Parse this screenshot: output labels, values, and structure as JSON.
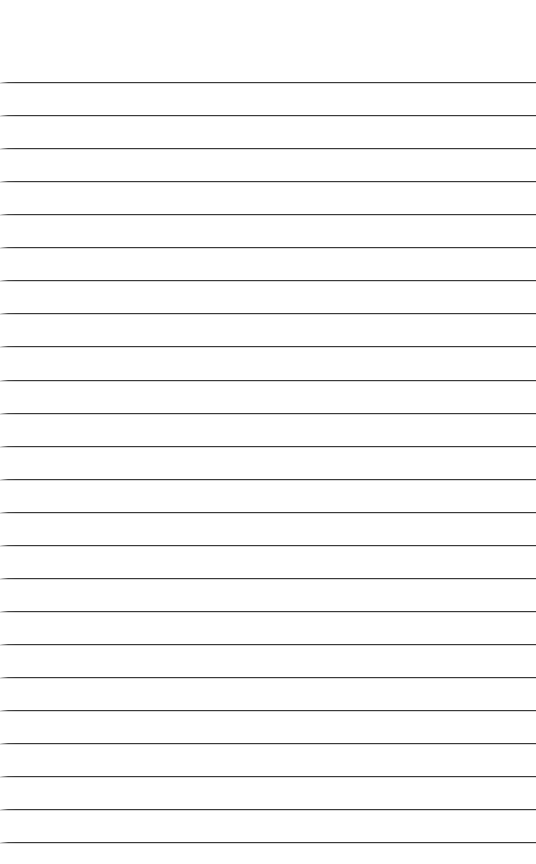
{
  "page": {
    "kind": "ruled-paper-sheet",
    "width": 536,
    "height": 864,
    "background_color": "#ffffff",
    "text_content": "",
    "is_blank": "true"
  },
  "rules": {
    "count": 24,
    "color": "#3a3a3a",
    "thickness_px": 1.3,
    "spacing_px": 33.0,
    "first_line_y": 82,
    "last_line_y": 842,
    "left_inset_px": 0,
    "right_inset_px": 0,
    "top_margin_px": 81,
    "bottom_margin_px": 22,
    "positions": [
      82,
      115,
      148,
      181,
      214,
      247,
      280,
      313,
      346,
      380,
      413,
      446,
      479,
      512,
      545,
      578,
      611,
      644,
      677,
      710,
      743,
      776,
      809,
      842
    ],
    "line_labels": [
      "line-1",
      "line-2",
      "line-3",
      "line-4",
      "line-5",
      "line-6",
      "line-7",
      "line-8",
      "line-9",
      "line-10",
      "line-11",
      "line-12",
      "line-13",
      "line-14",
      "line-15",
      "line-16",
      "line-17",
      "line-18",
      "line-19",
      "line-20",
      "line-21",
      "line-22",
      "line-23",
      "line-24"
    ],
    "row_values": [
      "",
      "",
      "",
      "",
      "",
      "",
      "",
      "",
      "",
      "",
      "",
      "",
      "",
      "",
      "",
      "",
      "",
      "",
      "",
      "",
      "",
      "",
      "",
      ""
    ]
  }
}
